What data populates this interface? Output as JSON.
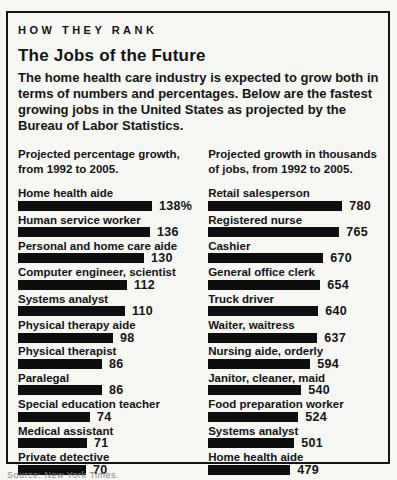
{
  "panel": {
    "kicker": "HOW THEY RANK",
    "title": "The Jobs of the Future",
    "intro": "The home health care industry is expected to grow both in terms of numbers and percentages. Below are the fastest growing jobs in the United States as projected by the Bureau of Labor Statistics.",
    "footer_clipped": "Source: New York Times."
  },
  "colors": {
    "bar": "#0e0e0e",
    "text": "#141414",
    "border": "#141414",
    "background": "#f6f6f3"
  },
  "columns": [
    {
      "id": "percentage-growth",
      "header": "Projected percentage growth, from 1992 to 2005.",
      "items": [
        {
          "label": "Home health aide",
          "value": 138,
          "value_label": "138%"
        },
        {
          "label": "Human service worker",
          "value": 136,
          "value_label": "136"
        },
        {
          "label": "Personal and home care aide",
          "value": 130,
          "value_label": "130"
        },
        {
          "label": "Computer engineer, scientist",
          "value": 112,
          "value_label": "112"
        },
        {
          "label": "Systems analyst",
          "value": 110,
          "value_label": "110"
        },
        {
          "label": "Physical therapy aide",
          "value": 98,
          "value_label": "98"
        },
        {
          "label": "Physical therapist",
          "value": 86,
          "value_label": "86"
        },
        {
          "label": "Paralegal",
          "value": 86,
          "value_label": "86"
        },
        {
          "label": "Special education teacher",
          "value": 74,
          "value_label": "74"
        },
        {
          "label": "Medical assistant",
          "value": 71,
          "value_label": "71"
        },
        {
          "label": "Private detective",
          "value": 70,
          "value_label": "70"
        }
      ]
    },
    {
      "id": "growth-thousands",
      "header": "Projected growth in thousands of jobs, from 1992 to 2005.",
      "items": [
        {
          "label": "Retail salesperson",
          "value": 780,
          "value_label": "780"
        },
        {
          "label": "Registered nurse",
          "value": 765,
          "value_label": "765"
        },
        {
          "label": "Cashier",
          "value": 670,
          "value_label": "670"
        },
        {
          "label": "General office clerk",
          "value": 654,
          "value_label": "654"
        },
        {
          "label": "Truck driver",
          "value": 640,
          "value_label": "640"
        },
        {
          "label": "Waiter, waitress",
          "value": 637,
          "value_label": "637"
        },
        {
          "label": "Nursing aide, orderly",
          "value": 594,
          "value_label": "594"
        },
        {
          "label": "Janitor, cleaner, maid",
          "value": 540,
          "value_label": "540"
        },
        {
          "label": "Food preparation worker",
          "value": 524,
          "value_label": "524"
        },
        {
          "label": "Systems analyst",
          "value": 501,
          "value_label": "501"
        },
        {
          "label": "Home health aide",
          "value": 479,
          "value_label": "479"
        }
      ]
    }
  ],
  "chart_data": [
    {
      "type": "bar",
      "orientation": "horizontal",
      "title": "Projected percentage growth, from 1992 to 2005.",
      "categories": [
        "Home health aide",
        "Human service worker",
        "Personal and home care aide",
        "Computer engineer, scientist",
        "Systems analyst",
        "Physical therapy aide",
        "Physical therapist",
        "Paralegal",
        "Special education teacher",
        "Medical assistant",
        "Private detective"
      ],
      "values": [
        138,
        136,
        130,
        112,
        110,
        98,
        86,
        86,
        74,
        71,
        70
      ],
      "xlabel": "",
      "ylabel": "",
      "unit": "percent",
      "xlim": [
        0,
        138
      ],
      "grid": false,
      "legend": false,
      "bar_color": "#0e0e0e"
    },
    {
      "type": "bar",
      "orientation": "horizontal",
      "title": "Projected growth in thousands of jobs, from 1992 to 2005.",
      "categories": [
        "Retail salesperson",
        "Registered nurse",
        "Cashier",
        "General office clerk",
        "Truck driver",
        "Waiter, waitress",
        "Nursing aide, orderly",
        "Janitor, cleaner, maid",
        "Food preparation worker",
        "Systems analyst",
        "Home health aide"
      ],
      "values": [
        780,
        765,
        670,
        654,
        640,
        637,
        594,
        540,
        524,
        501,
        479
      ],
      "xlabel": "",
      "ylabel": "",
      "unit": "thousands of jobs",
      "xlim": [
        0,
        780
      ],
      "grid": false,
      "legend": false,
      "bar_color": "#0e0e0e"
    }
  ]
}
